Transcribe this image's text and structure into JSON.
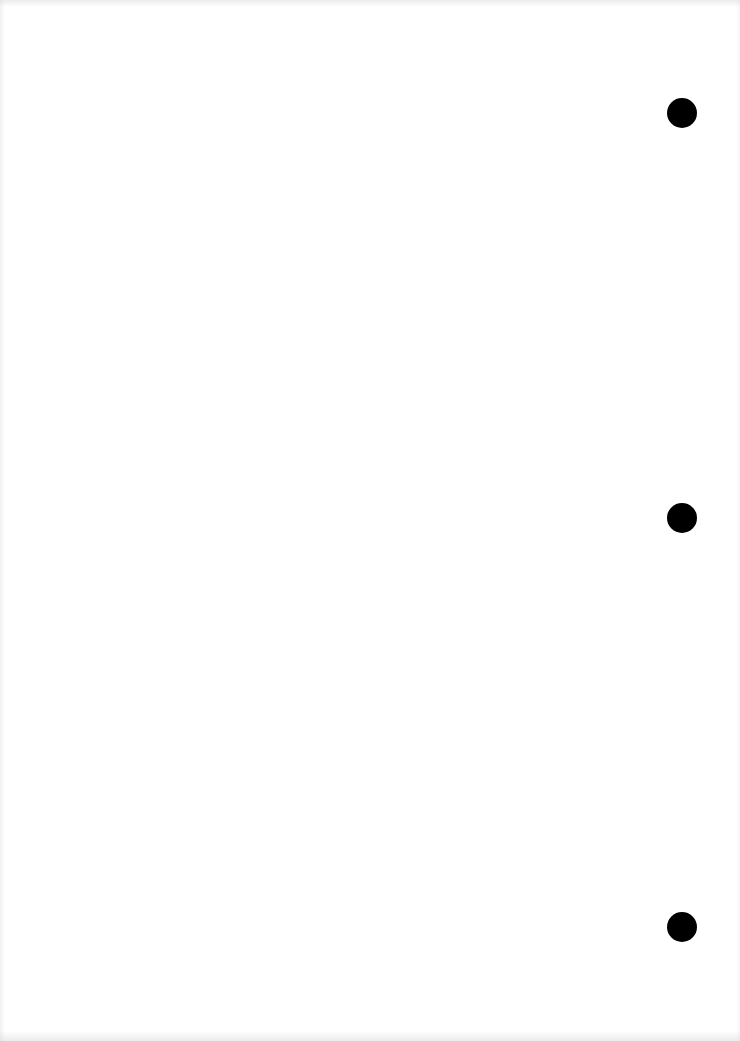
{
  "page": {
    "type": "blank scanned sheet",
    "background_color": "#ffffff",
    "text": ""
  },
  "punch_holes": [
    {
      "cx": 682,
      "cy": 113,
      "r": 15,
      "color": "#000000"
    },
    {
      "cx": 682,
      "cy": 518,
      "r": 15,
      "color": "#000000"
    },
    {
      "cx": 682,
      "cy": 927,
      "r": 15,
      "color": "#000000"
    }
  ]
}
